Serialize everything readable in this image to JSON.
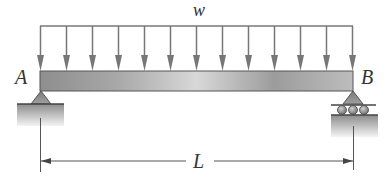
{
  "diagram": {
    "type": "simply-supported-beam-uniform-load",
    "load_label": "w",
    "left_support_label": "A",
    "right_support_label": "B",
    "span_label": "L",
    "left_support_type": "pin",
    "right_support_type": "roller",
    "arrow_count": 13,
    "colors": {
      "line": "#6e6e6e",
      "arrow": "#777777",
      "beam_dark": "#8a8a8a",
      "beam_light": "#d9d9d9",
      "text": "#333333"
    }
  }
}
